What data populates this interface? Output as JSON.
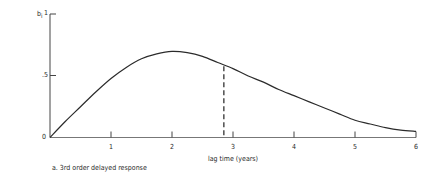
{
  "chart_data": {
    "type": "line",
    "title": "",
    "caption": "a. 3rd order delayed response",
    "xlabel": "lag time (years)",
    "ylabel": "b_i",
    "xlim": [
      0,
      6
    ],
    "ylim": [
      0,
      1
    ],
    "x_ticks": [
      "1",
      "2",
      "3",
      "4",
      "5",
      "6"
    ],
    "y_ticks": [
      "0",
      ".5",
      "1"
    ],
    "grid": false,
    "legend": null,
    "series": [
      {
        "name": "3rd order delayed response",
        "x": [
          0,
          0.25,
          0.5,
          0.75,
          1,
          1.25,
          1.5,
          1.75,
          2,
          2.25,
          2.5,
          2.75,
          3,
          3.25,
          3.5,
          3.75,
          4,
          4.25,
          4.5,
          4.75,
          5,
          5.25,
          5.5,
          5.75,
          6
        ],
        "values": [
          0,
          0.13,
          0.25,
          0.37,
          0.48,
          0.57,
          0.64,
          0.68,
          0.7,
          0.69,
          0.66,
          0.61,
          0.56,
          0.5,
          0.45,
          0.39,
          0.34,
          0.29,
          0.24,
          0.19,
          0.14,
          0.11,
          0.08,
          0.06,
          0.05
        ]
      }
    ],
    "annotations": [
      {
        "type": "dashed-vertical-line",
        "x": 2.85,
        "y_top": 0.58,
        "note": "mean lag marker"
      }
    ]
  },
  "labels": {
    "y_axis_symbol": "b",
    "y_axis_subscript": "i",
    "y_tick_0": "0",
    "y_tick_half": ".5",
    "y_tick_1": "1",
    "x_ticks": [
      "1",
      "2",
      "3",
      "4",
      "5",
      "6"
    ],
    "x_axis_title": "lag time (years)",
    "caption": "a. 3rd order delayed response"
  },
  "colors": {
    "line": "#2b2b2b",
    "axis": "#444444",
    "background": "#ffffff"
  }
}
